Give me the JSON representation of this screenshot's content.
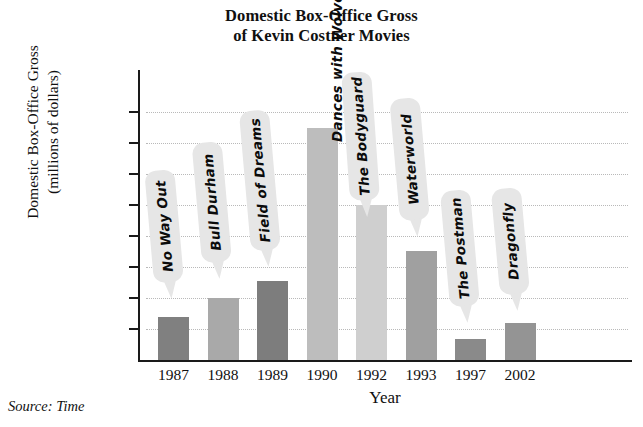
{
  "chart_data": {
    "type": "bar",
    "title": "Domestic Box-Office Gross of Kevin Costner Movies",
    "title_line1": "Domestic Box-Office Gross",
    "title_line2": "of Kevin Costner Movies",
    "xlabel": "Year",
    "ylabel": "Domestic Box-Office Gross (millions of dollars)",
    "ylabel_line1": "Domestic Box-Office Gross",
    "ylabel_line2": "(millions of dollars)",
    "categories": [
      "1987",
      "1988",
      "1989",
      "1990",
      "1992",
      "1993",
      "1997",
      "2002"
    ],
    "values": [
      35,
      50,
      64,
      187,
      125,
      88,
      17,
      30
    ],
    "point_labels": [
      "No Way Out",
      "Bull Durham",
      "Field of Dreams",
      "Dances with Wolves",
      "The Bodyguard",
      "Waterworld",
      "The Postman",
      "Dragonfly"
    ],
    "bar_colors": [
      "#808080",
      "#a9a9a9",
      "#7d7d7d",
      "#bdbdbd",
      "#cfcfcf",
      "#a0a0a0",
      "#8a8a8a",
      "#949494"
    ],
    "ylim": [
      0,
      200
    ],
    "yticks": [
      "25",
      "50",
      "75",
      "100",
      "125",
      "150",
      "175",
      "200"
    ],
    "ytick_values": [
      25,
      50,
      75,
      100,
      125,
      150,
      175,
      200
    ],
    "grid": true,
    "legend": "none",
    "source": "Source: Time"
  },
  "colors": {
    "axis": "#1a1a1a",
    "gridline": "#b9b9b9",
    "callout_bg": "#e6e6e6",
    "text": "#101010"
  }
}
